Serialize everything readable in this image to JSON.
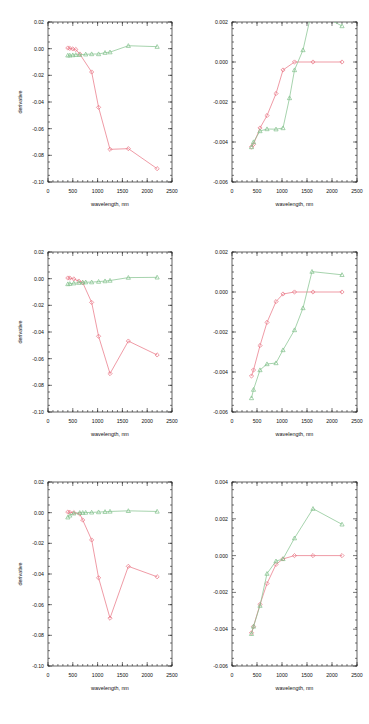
{
  "figure": {
    "title": "",
    "rows": 3,
    "cols": 2,
    "background": "#ffffff",
    "colors": {
      "red": "#e8707f",
      "green": "#7fc08a",
      "axis": "#222222"
    }
  },
  "axis_titles": {
    "x": "wavelength, nm",
    "y": "derivative"
  },
  "chart_data": [
    {
      "id": "panel-r1c1",
      "type": "line",
      "title": "",
      "xlabel": "wavelength, nm",
      "ylabel": "derivative",
      "xlim": [
        0,
        2500
      ],
      "ylim": [
        -0.1,
        0.02
      ],
      "xticks": [
        0,
        500,
        1000,
        1500,
        2000,
        2500
      ],
      "yticks": [
        0.02,
        0.0,
        -0.02,
        -0.04,
        -0.06,
        -0.08,
        -0.1
      ],
      "xticklabels": [
        "0",
        "500",
        "1000",
        "1500",
        "2000",
        "2500"
      ],
      "yticklabels": [
        "0.02",
        "0.00",
        "-0.02",
        "-0.04",
        "-0.06",
        "-0.08",
        "-0.10"
      ],
      "grid": false,
      "legend": "none",
      "series": [
        {
          "name": "red",
          "color": "#e8707f",
          "marker": "diamond",
          "x": [
            400,
            440,
            500,
            560,
            640,
            880,
            1020,
            1250,
            1620,
            2200
          ],
          "y": [
            0.0005,
            0.0002,
            -0.0002,
            -0.0006,
            -0.004,
            -0.0175,
            -0.044,
            -0.0755,
            -0.075,
            -0.09
          ]
        },
        {
          "name": "green",
          "color": "#7fc08a",
          "marker": "triangle",
          "x": [
            400,
            440,
            500,
            560,
            640,
            760,
            880,
            1020,
            1150,
            1250,
            1620,
            2200
          ],
          "y": [
            -0.005,
            -0.005,
            -0.0048,
            -0.0046,
            -0.0046,
            -0.0042,
            -0.004,
            -0.004,
            -0.003,
            -0.0026,
            0.0022,
            0.0015
          ]
        }
      ]
    },
    {
      "id": "panel-r1c2",
      "type": "line",
      "title": "",
      "xlabel": "wavelength, nm",
      "ylabel": "",
      "xlim": [
        0,
        2500
      ],
      "ylim": [
        -0.006,
        0.002
      ],
      "xticks": [
        0,
        500,
        1000,
        1500,
        2000,
        2500
      ],
      "yticks": [
        0.002,
        0.0,
        -0.002,
        -0.004,
        -0.006
      ],
      "xticklabels": [
        "0",
        "500",
        "1000",
        "1500",
        "2000",
        "2500"
      ],
      "yticklabels": [
        "0.002",
        "0.000",
        "-0.002",
        "-0.004",
        "-0.006"
      ],
      "grid": false,
      "legend": "none",
      "series": [
        {
          "name": "red",
          "color": "#e8707f",
          "marker": "diamond",
          "x": [
            390,
            430,
            560,
            700,
            880,
            1020,
            1250,
            1620,
            2200
          ],
          "y": [
            -0.00425,
            -0.00412,
            -0.0033,
            -0.00268,
            -0.00158,
            -0.0004,
            0.0,
            0.0,
            0.0
          ]
        },
        {
          "name": "green",
          "color": "#7fc08a",
          "marker": "triangle",
          "x": [
            390,
            430,
            560,
            700,
            880,
            1020,
            1150,
            1250,
            1420,
            1600,
            1900,
            2200
          ],
          "y": [
            -0.00425,
            -0.004,
            -0.00345,
            -0.00335,
            -0.00336,
            -0.0033,
            -0.0018,
            -0.0004,
            0.0006,
            0.0026,
            0.0022,
            0.0018
          ]
        }
      ]
    },
    {
      "id": "panel-r2c1",
      "type": "line",
      "title": "",
      "xlabel": "wavelength, nm",
      "ylabel": "derivative",
      "xlim": [
        0,
        2500
      ],
      "ylim": [
        -0.1,
        0.02
      ],
      "xticks": [
        0,
        500,
        1000,
        1500,
        2000,
        2500
      ],
      "yticks": [
        0.02,
        0.0,
        -0.02,
        -0.04,
        -0.06,
        -0.08,
        -0.1
      ],
      "xticklabels": [
        "0",
        "500",
        "1000",
        "1500",
        "2000",
        "2500"
      ],
      "yticklabels": [
        "0.02",
        "0.00",
        "-0.02",
        "-0.04",
        "-0.06",
        "-0.08",
        "-0.10"
      ],
      "grid": false,
      "legend": "none",
      "series": [
        {
          "name": "red",
          "color": "#e8707f",
          "marker": "diamond",
          "x": [
            400,
            440,
            520,
            620,
            700,
            880,
            1020,
            1250,
            1620,
            2200
          ],
          "y": [
            0.0005,
            0.0004,
            -0.0002,
            -0.0018,
            -0.003,
            -0.0178,
            -0.0432,
            -0.0712,
            -0.0468,
            -0.0572
          ]
        },
        {
          "name": "green",
          "color": "#7fc08a",
          "marker": "triangle",
          "x": [
            400,
            440,
            520,
            620,
            700,
            760,
            880,
            1020,
            1150,
            1250,
            1620,
            2200
          ],
          "y": [
            -0.004,
            -0.0038,
            -0.0034,
            -0.003,
            -0.0028,
            -0.0026,
            -0.0026,
            -0.0022,
            -0.0018,
            -0.0014,
            0.0008,
            0.001
          ]
        }
      ]
    },
    {
      "id": "panel-r2c2",
      "type": "line",
      "title": "",
      "xlabel": "wavelength, nm",
      "ylabel": "",
      "xlim": [
        0,
        2500
      ],
      "ylim": [
        -0.006,
        0.002
      ],
      "xticks": [
        0,
        500,
        1000,
        1500,
        2000,
        2500
      ],
      "yticks": [
        0.002,
        0.0,
        -0.002,
        -0.004,
        -0.006
      ],
      "xticklabels": [
        "0",
        "500",
        "1000",
        "1500",
        "2000",
        "2500"
      ],
      "yticklabels": [
        "0.002",
        "0.000",
        "-0.002",
        "-0.004",
        "-0.006"
      ],
      "grid": false,
      "legend": "none",
      "series": [
        {
          "name": "red",
          "color": "#e8707f",
          "marker": "diamond",
          "x": [
            390,
            430,
            560,
            700,
            880,
            1020,
            1250,
            1620,
            2200
          ],
          "y": [
            -0.0042,
            -0.0039,
            -0.00268,
            -0.00152,
            -0.00048,
            -0.0001,
            0.0,
            0.0,
            0.0
          ]
        },
        {
          "name": "green",
          "color": "#7fc08a",
          "marker": "triangle",
          "x": [
            390,
            430,
            560,
            700,
            880,
            1020,
            1250,
            1420,
            1600,
            2200
          ],
          "y": [
            -0.0053,
            -0.00488,
            -0.0039,
            -0.0036,
            -0.00355,
            -0.0029,
            -0.0019,
            -0.0008,
            0.00102,
            0.00086
          ]
        }
      ]
    },
    {
      "id": "panel-r3c1",
      "type": "line",
      "title": "",
      "xlabel": "wavelength, nm",
      "ylabel": "derivative",
      "xlim": [
        0,
        2500
      ],
      "ylim": [
        -0.1,
        0.02
      ],
      "xticks": [
        0,
        500,
        1000,
        1500,
        2000,
        2500
      ],
      "yticks": [
        0.02,
        0.0,
        -0.02,
        -0.04,
        -0.06,
        -0.08,
        -0.1
      ],
      "xticklabels": [
        "0",
        "500",
        "1000",
        "1500",
        "2000",
        "2500"
      ],
      "yticklabels": [
        "0.02",
        "0.00",
        "-0.02",
        "-0.04",
        "-0.06",
        "-0.08",
        "-0.10"
      ],
      "grid": false,
      "legend": "none",
      "series": [
        {
          "name": "red",
          "color": "#e8707f",
          "marker": "diamond",
          "x": [
            400,
            440,
            520,
            640,
            700,
            880,
            1020,
            1250,
            1620,
            2200
          ],
          "y": [
            0.0004,
            0.0002,
            0.0,
            -0.0008,
            -0.0048,
            -0.0178,
            -0.0425,
            -0.0688,
            -0.035,
            -0.0418
          ]
        },
        {
          "name": "green",
          "color": "#7fc08a",
          "marker": "triangle",
          "x": [
            400,
            440,
            520,
            640,
            700,
            760,
            880,
            1020,
            1150,
            1250,
            1620,
            2200
          ],
          "y": [
            -0.003,
            -0.0018,
            -0.0004,
            0.0,
            0.0,
            0.0001,
            0.0002,
            0.0004,
            0.0006,
            0.0008,
            0.0012,
            0.0008
          ]
        }
      ]
    },
    {
      "id": "panel-r3c2",
      "type": "line",
      "title": "",
      "xlabel": "wavelength, nm",
      "ylabel": "",
      "xlim": [
        0,
        2500
      ],
      "ylim": [
        -0.006,
        0.004
      ],
      "xticks": [
        0,
        500,
        1000,
        1500,
        2000,
        2500
      ],
      "yticks": [
        0.004,
        0.002,
        0.0,
        -0.002,
        -0.004,
        -0.006
      ],
      "xticklabels": [
        "0",
        "500",
        "1000",
        "1500",
        "2000",
        "2500"
      ],
      "yticklabels": [
        "0.004",
        "0.002",
        "0.000",
        "-0.002",
        "-0.004",
        "-0.006"
      ],
      "grid": false,
      "legend": "none",
      "series": [
        {
          "name": "red",
          "color": "#e8707f",
          "marker": "diamond",
          "x": [
            390,
            430,
            560,
            700,
            880,
            1020,
            1250,
            1620,
            2200
          ],
          "y": [
            -0.0042,
            -0.00385,
            -0.00265,
            -0.00152,
            -0.00048,
            -0.00018,
            0.0,
            0.0,
            0.0
          ]
        },
        {
          "name": "green",
          "color": "#7fc08a",
          "marker": "triangle",
          "x": [
            390,
            430,
            560,
            700,
            880,
            1020,
            1250,
            1620,
            2200
          ],
          "y": [
            -0.00425,
            -0.00385,
            -0.00272,
            -0.00098,
            -0.0003,
            -0.00018,
            0.00095,
            0.00255,
            0.0017
          ]
        }
      ]
    }
  ]
}
